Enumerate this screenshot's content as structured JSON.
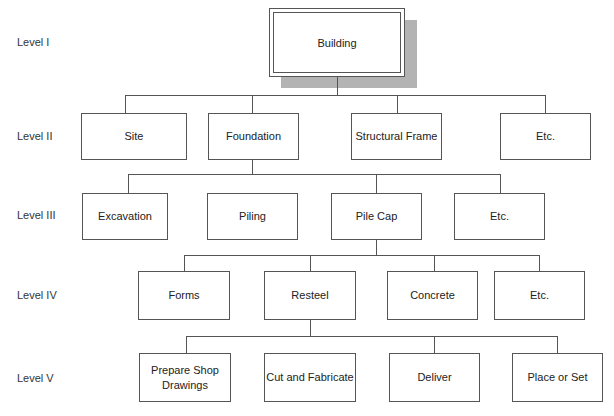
{
  "levels": [
    "Level I",
    "Level II",
    "Level III",
    "Level IV",
    "Level V"
  ],
  "root": {
    "label": "Building"
  },
  "level2": [
    {
      "label": "Site"
    },
    {
      "label": "Foundation"
    },
    {
      "label": "Structural Frame"
    },
    {
      "label": "Etc."
    }
  ],
  "level3": [
    {
      "label": "Excavation"
    },
    {
      "label": "Piling"
    },
    {
      "label": "Pile Cap"
    },
    {
      "label": "Etc."
    }
  ],
  "level4": [
    {
      "label": "Forms"
    },
    {
      "label": "Resteel"
    },
    {
      "label": "Concrete"
    },
    {
      "label": "Etc."
    }
  ],
  "level5": [
    {
      "label": "Prepare Shop Drawings"
    },
    {
      "label": "Cut and Fabricate"
    },
    {
      "label": "Deliver"
    },
    {
      "label": "Place or Set"
    }
  ],
  "colors": {
    "line": "#555555",
    "shadow": "#b3b3b3",
    "background": "#ffffff"
  }
}
